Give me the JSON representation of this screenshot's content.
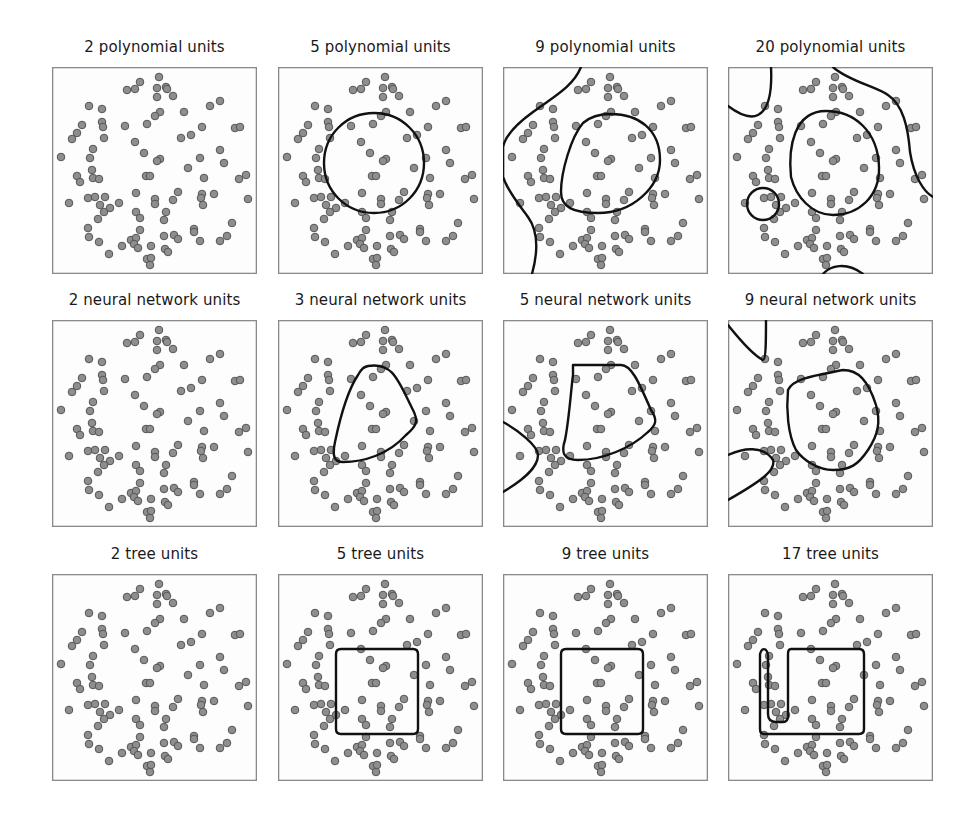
{
  "figure": {
    "rows": [
      {
        "model": "polynomial",
        "panels": [
          {
            "title": "2 polynomial units",
            "units": 2,
            "boundary": "none"
          },
          {
            "title": "5 polynomial units",
            "units": 5,
            "boundary": "circle"
          },
          {
            "title": "9 polynomial units",
            "units": 9,
            "boundary": "oval + left curve"
          },
          {
            "title": "20 polynomial units",
            "units": 20,
            "boundary": "multiple closed regions"
          }
        ]
      },
      {
        "model": "neural network",
        "panels": [
          {
            "title": "2 neural network units",
            "units": 2,
            "boundary": "none"
          },
          {
            "title": "3 neural network units",
            "units": 3,
            "boundary": "rounded triangle"
          },
          {
            "title": "5 neural network units",
            "units": 5,
            "boundary": "polygon + corner region"
          },
          {
            "title": "9 neural network units",
            "units": 9,
            "boundary": "polygon + two corner regions"
          }
        ]
      },
      {
        "model": "tree",
        "panels": [
          {
            "title": "2 tree units",
            "units": 2,
            "boundary": "none"
          },
          {
            "title": "5 tree units",
            "units": 5,
            "boundary": "rectangle"
          },
          {
            "title": "9 tree units",
            "units": 9,
            "boundary": "rectangle"
          },
          {
            "title": "17 tree units",
            "units": 17,
            "boundary": "rectangle + narrow extension"
          }
        ]
      }
    ],
    "colors": {
      "point_fill": "#8e8e8e",
      "point_stroke": "#555555",
      "boundary": "#111111",
      "frame": "#8a8a8a"
    }
  },
  "chart_data": {
    "type": "scatter",
    "title": "",
    "xlabel": "",
    "ylabel": "",
    "grid": false,
    "legend": "none",
    "layout": "3x4 small multiples; same dataset in every panel, decision boundary overlaid",
    "panel_titles": [
      "2 polynomial units",
      "5 polynomial units",
      "9 polynomial units",
      "20 polynomial units",
      "2 neural network units",
      "3 neural network units",
      "5 neural network units",
      "9 neural network units",
      "2 tree units",
      "5 tree units",
      "9 tree units",
      "17 tree units"
    ],
    "panel_size": [
      205,
      207
    ],
    "points": [
      [
        107,
        10
      ],
      [
        88,
        15
      ],
      [
        75,
        23
      ],
      [
        83,
        22
      ],
      [
        105,
        21
      ],
      [
        114,
        20
      ],
      [
        115,
        22
      ],
      [
        105,
        30
      ],
      [
        121,
        29
      ],
      [
        37,
        39
      ],
      [
        50,
        42
      ],
      [
        158,
        39
      ],
      [
        168,
        34
      ],
      [
        132,
        45
      ],
      [
        108,
        45
      ],
      [
        103,
        49
      ],
      [
        50,
        55
      ],
      [
        51,
        60
      ],
      [
        30,
        58
      ],
      [
        25,
        66
      ],
      [
        20,
        72
      ],
      [
        52,
        71
      ],
      [
        73,
        59
      ],
      [
        95,
        57
      ],
      [
        150,
        60
      ],
      [
        183,
        61
      ],
      [
        188,
        60
      ],
      [
        139,
        68
      ],
      [
        129,
        71
      ],
      [
        83,
        75
      ],
      [
        41,
        82
      ],
      [
        38,
        91
      ],
      [
        9,
        90
      ],
      [
        92,
        86
      ],
      [
        108,
        92
      ],
      [
        105,
        94
      ],
      [
        148,
        91
      ],
      [
        168,
        83
      ],
      [
        172,
        96
      ],
      [
        136,
        101
      ],
      [
        40,
        103
      ],
      [
        25,
        109
      ],
      [
        28,
        115
      ],
      [
        41,
        111
      ],
      [
        47,
        112
      ],
      [
        94,
        109
      ],
      [
        98,
        109
      ],
      [
        152,
        111
      ],
      [
        187,
        112
      ],
      [
        194,
        108
      ],
      [
        17,
        136
      ],
      [
        36,
        131
      ],
      [
        43,
        130
      ],
      [
        53,
        130
      ],
      [
        48,
        138
      ],
      [
        58,
        141
      ],
      [
        67,
        136
      ],
      [
        52,
        145
      ],
      [
        46,
        152
      ],
      [
        84,
        126
      ],
      [
        103,
        132
      ],
      [
        103,
        137
      ],
      [
        126,
        125
      ],
      [
        121,
        133
      ],
      [
        150,
        127
      ],
      [
        149,
        131
      ],
      [
        151,
        138
      ],
      [
        162,
        127
      ],
      [
        196,
        132
      ],
      [
        84,
        145
      ],
      [
        88,
        151
      ],
      [
        114,
        145
      ],
      [
        112,
        153
      ],
      [
        36,
        161
      ],
      [
        37,
        170
      ],
      [
        47,
        175
      ],
      [
        88,
        163
      ],
      [
        79,
        173
      ],
      [
        84,
        171
      ],
      [
        82,
        177
      ],
      [
        86,
        181
      ],
      [
        70,
        179
      ],
      [
        99,
        179
      ],
      [
        57,
        187
      ],
      [
        95,
        192
      ],
      [
        99,
        191
      ],
      [
        98,
        198
      ],
      [
        112,
        169
      ],
      [
        122,
        168
      ],
      [
        126,
        172
      ],
      [
        113,
        182
      ],
      [
        116,
        185
      ],
      [
        142,
        162
      ],
      [
        142,
        165
      ],
      [
        148,
        174
      ],
      [
        168,
        174
      ],
      [
        175,
        169
      ],
      [
        180,
        156
      ]
    ],
    "boundaries": [
      {
        "panel": "2 polynomial units",
        "shapes": []
      },
      {
        "panel": "5 polynomial units",
        "shapes": [
          "circle centre≈(96,96) r≈50"
        ]
      },
      {
        "panel": "9 polynomial units",
        "shapes": [
          "closed oval centre≈(102,96)",
          "open curve along left edge"
        ]
      },
      {
        "panel": "20 polynomial units",
        "shapes": [
          "closed oval centre≈(98,98)",
          "top-left blob",
          "small circle lower-left",
          "curve top-right to right edge",
          "arc at bottom"
        ]
      },
      {
        "panel": "2 neural network units",
        "shapes": []
      },
      {
        "panel": "3 neural network units",
        "shapes": [
          "rounded triangle"
        ]
      },
      {
        "panel": "5 neural network units",
        "shapes": [
          "rounded polygon",
          "bottom-left corner region"
        ]
      },
      {
        "panel": "9 neural network units",
        "shapes": [
          "rounded polygon",
          "top-left corner region",
          "bottom-left region"
        ]
      },
      {
        "panel": "2 tree units",
        "shapes": []
      },
      {
        "panel": "5 tree units",
        "shapes": [
          "rectangle x≈60-140 y≈75-160"
        ]
      },
      {
        "panel": "9 tree units",
        "shapes": [
          "rectangle x≈60-140 y≈75-160"
        ]
      },
      {
        "panel": "17 tree units",
        "shapes": [
          "rectangle x≈60-138 y≈75-160 with narrow strip x≈32-60 extending up to y≈75"
        ]
      }
    ]
  }
}
